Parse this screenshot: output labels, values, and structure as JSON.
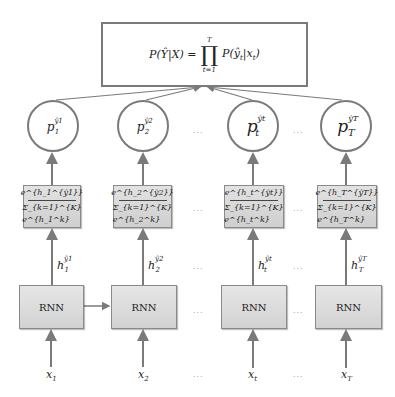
{
  "diagram": {
    "top": {
      "lhs": "P(Ŷ|X) =",
      "prod_upper": "T",
      "prod_symbol": "∏",
      "prod_lower": "t=1",
      "rhs": "P(ŷ",
      "rhs_sub": "t",
      "rhs_mid": "|x",
      "rhs_sub2": "t",
      "rhs_end": ")"
    },
    "columns": [
      {
        "p_base": "p",
        "p_sup": "ŷ1",
        "p_sub": "1",
        "softmax_num": "e^{h_1^{ŷ1}}",
        "softmax_den": "Σ_{k=1}^{K} e^{h_1^k}",
        "h_base": "h",
        "h_sup": "ŷ1",
        "h_sub": "1",
        "rnn": "RNN",
        "x_base": "x",
        "x_sub": "1"
      },
      {
        "p_base": "p",
        "p_sup": "ŷ2",
        "p_sub": "2",
        "softmax_num": "e^{h_2^{ŷ2}}",
        "softmax_den": "Σ_{k=1}^{K} e^{h_2^k}",
        "h_base": "h",
        "h_sup": "ŷ2",
        "h_sub": "2",
        "rnn": "RNN",
        "x_base": "x",
        "x_sub": "2"
      },
      {
        "p_base": "p",
        "p_sup": "ŷt",
        "p_sub": "t",
        "softmax_num": "e^{h_t^{ŷt}}",
        "softmax_den": "Σ_{k=1}^{K} e^{h_t^k}",
        "h_base": "h",
        "h_sup": "ŷt",
        "h_sub": "t",
        "rnn": "RNN",
        "x_base": "x",
        "x_sub": "t"
      },
      {
        "p_base": "p",
        "p_sup": "ŷT",
        "p_sub": "T",
        "softmax_num": "e^{h_T^{ŷT}}",
        "softmax_den": "Σ_{k=1}^{K} e^{h_T^k}",
        "h_base": "h",
        "h_sup": "ŷT",
        "h_sub": "T",
        "rnn": "RNN",
        "x_base": "x",
        "x_sub": "T"
      }
    ],
    "ellipsis": "...",
    "colors": {
      "stroke": "#7a7a7a",
      "box_fill": "#d8d8d8",
      "background": "#ffffff"
    }
  }
}
